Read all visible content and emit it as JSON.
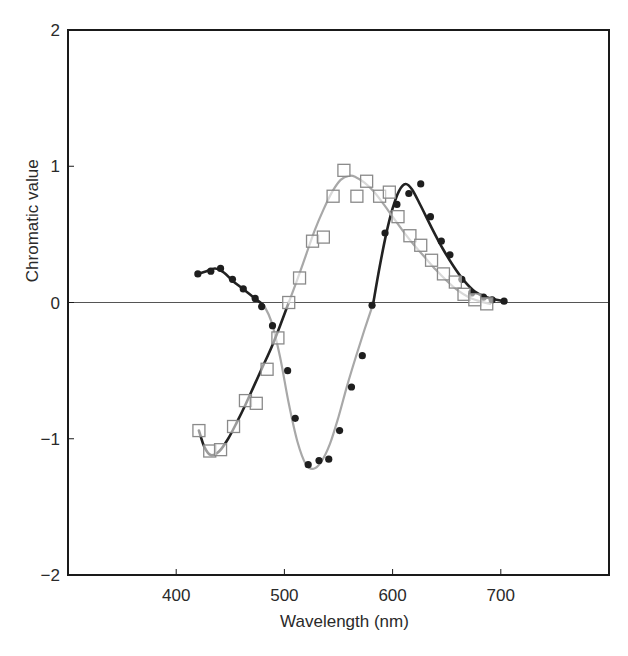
{
  "chart_data": {
    "type": "scatter",
    "title": "",
    "xlabel": "Wavelength (nm)",
    "ylabel": "Chromatic value",
    "xlim": [
      300,
      800
    ],
    "ylim": [
      -2,
      2
    ],
    "x_ticks": [
      400,
      500,
      600,
      700
    ],
    "y_ticks": [
      -2,
      -1,
      0,
      1,
      2
    ],
    "x_tick_labels": [
      "400",
      "500",
      "600",
      "700"
    ],
    "y_tick_labels": [
      "−2",
      "−1",
      "0",
      "1",
      "2"
    ],
    "grid": false,
    "legend": null,
    "zero_line": true,
    "series": [
      {
        "name": "filled-circles",
        "marker": "filled-circle",
        "color": "#1e1e1e",
        "x": [
          420,
          432,
          441,
          452,
          462,
          473,
          479,
          489,
          503,
          510,
          522,
          532,
          541,
          551,
          562,
          572,
          581,
          593,
          604,
          615,
          626,
          635,
          645,
          653,
          664,
          673,
          684,
          692,
          703
        ],
        "values": [
          0.21,
          0.23,
          0.25,
          0.17,
          0.1,
          0.03,
          -0.03,
          -0.17,
          -0.5,
          -0.85,
          -1.19,
          -1.16,
          -1.15,
          -0.94,
          -0.62,
          -0.39,
          -0.02,
          0.51,
          0.72,
          0.8,
          0.87,
          0.63,
          0.45,
          0.35,
          0.17,
          0.07,
          0.04,
          0.02,
          0.01
        ]
      },
      {
        "name": "open-squares",
        "marker": "open-square",
        "color": "#8a8a8a",
        "x": [
          421,
          431,
          441,
          453,
          464,
          474,
          484,
          494,
          504,
          514,
          526,
          536,
          545,
          555,
          567,
          576,
          588,
          597,
          605,
          616,
          626,
          636,
          647,
          658,
          666,
          676,
          687
        ],
        "values": [
          -0.94,
          -1.09,
          -1.08,
          -0.91,
          -0.72,
          -0.74,
          -0.49,
          -0.26,
          0.0,
          0.18,
          0.45,
          0.48,
          0.78,
          0.97,
          0.78,
          0.89,
          0.78,
          0.81,
          0.63,
          0.49,
          0.42,
          0.31,
          0.21,
          0.15,
          0.06,
          0.02,
          -0.01
        ]
      }
    ],
    "fit_curves": [
      {
        "name": "curve-through-circles",
        "segments": [
          {
            "color": "#222222",
            "x": [
              420,
              428,
              436,
              444,
              452,
              460,
              468,
              476,
              481
            ],
            "values": [
              0.21,
              0.23,
              0.25,
              0.22,
              0.16,
              0.11,
              0.06,
              0.01,
              -0.02
            ]
          },
          {
            "color": "#a8a8a8",
            "x": [
              481,
              488,
              496,
              504,
              512,
              520,
              527,
              534,
              542,
              550,
              558,
              566,
              574,
              582
            ],
            "values": [
              -0.02,
              -0.14,
              -0.4,
              -0.74,
              -1.02,
              -1.19,
              -1.22,
              -1.17,
              -1.04,
              -0.84,
              -0.61,
              -0.4,
              -0.2,
              -0.01
            ]
          },
          {
            "color": "#222222",
            "x": [
              582,
              588,
              594,
              600,
              606,
              612,
              618,
              626,
              636,
              646,
              656,
              666,
              676,
              686,
              696,
              703
            ],
            "values": [
              -0.01,
              0.26,
              0.5,
              0.69,
              0.82,
              0.87,
              0.83,
              0.71,
              0.55,
              0.4,
              0.27,
              0.16,
              0.08,
              0.04,
              0.02,
              0.01
            ]
          }
        ]
      },
      {
        "name": "curve-through-squares",
        "segments": [
          {
            "color": "#222222",
            "x": [
              421,
              426,
              432,
              440,
              448,
              456,
              464,
              472,
              480,
              488,
              496,
              504
            ],
            "values": [
              -0.94,
              -1.06,
              -1.12,
              -1.09,
              -1.0,
              -0.88,
              -0.75,
              -0.61,
              -0.47,
              -0.33,
              -0.17,
              0.0
            ]
          },
          {
            "color": "#a8a8a8",
            "x": [
              504,
              512,
              520,
              528,
              536,
              544,
              552,
              560,
              566,
              574,
              582,
              590,
              600,
              610,
              620,
              630,
              640,
              650,
              660,
              670,
              680,
              690
            ],
            "values": [
              0.0,
              0.17,
              0.35,
              0.53,
              0.68,
              0.81,
              0.9,
              0.93,
              0.92,
              0.88,
              0.82,
              0.74,
              0.63,
              0.52,
              0.42,
              0.33,
              0.24,
              0.16,
              0.09,
              0.04,
              0.01,
              -0.01
            ]
          }
        ]
      }
    ]
  }
}
